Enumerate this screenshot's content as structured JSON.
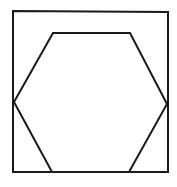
{
  "diagram": {
    "colors": {
      "background": "#ffffff",
      "stroke": "#1a1a1a"
    },
    "stroke_width": 2,
    "square": {
      "points": [
        [
          13,
          11
        ],
        [
          168,
          12
        ],
        [
          168,
          172
        ],
        [
          13,
          172
        ]
      ]
    },
    "hexagon": {
      "points": [
        [
          53,
          33
        ],
        [
          130,
          33
        ],
        [
          167,
          104
        ],
        [
          129,
          172
        ],
        [
          52,
          172
        ],
        [
          14,
          102
        ]
      ]
    }
  }
}
